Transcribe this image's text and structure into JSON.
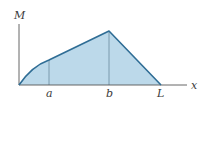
{
  "diagram": {
    "type": "bending-moment-diagram",
    "axes": {
      "y_label": "M",
      "x_label": "x"
    },
    "points": [
      {
        "name": "origin",
        "label": ""
      },
      {
        "name": "a",
        "label": "a"
      },
      {
        "name": "b",
        "label": "b"
      },
      {
        "name": "L",
        "label": "L"
      }
    ],
    "segments": [
      {
        "from": "origin",
        "to": "a",
        "shape": "curve"
      },
      {
        "from": "a",
        "to": "b",
        "shape": "line"
      },
      {
        "from": "b",
        "to": "L",
        "shape": "line"
      }
    ],
    "colors": {
      "fill": "#bcd9ea",
      "outline": "#2f6d95",
      "axis": "#555555",
      "guide": "#6b8aa0"
    }
  }
}
